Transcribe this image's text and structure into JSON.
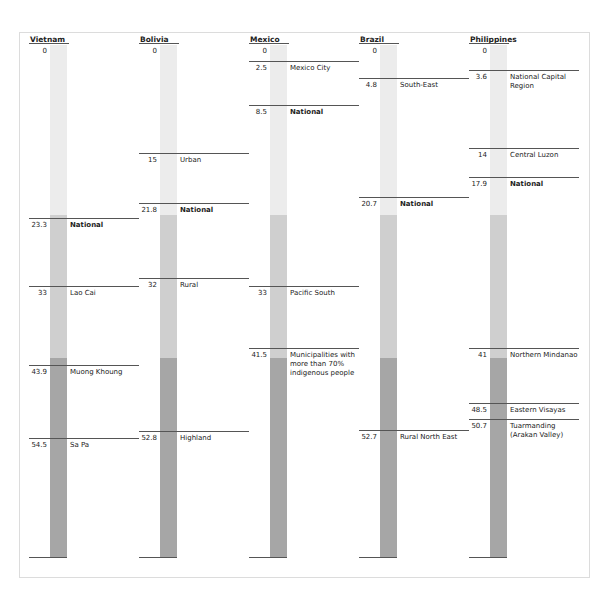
{
  "chart_data": {
    "type": "table",
    "title": "",
    "xlabel": "",
    "ylabel": "",
    "ylim": [
      0,
      60
    ],
    "band_colors": {
      "light": "#ececec",
      "mid": "#cfcfcf",
      "dark": "#a6a6a6"
    },
    "columns": [
      {
        "country": "Vietnam",
        "zero_label": "0",
        "markers": [
          {
            "value": 23.3,
            "value_label": "23.3",
            "label": "National",
            "bold": true,
            "y": 218
          },
          {
            "value": 33,
            "value_label": "33",
            "label": "Lao Cai",
            "bold": false,
            "y": 286
          },
          {
            "value": 43.9,
            "value_label": "43.9",
            "label": "Muong Khoung",
            "bold": false,
            "y": 365
          },
          {
            "value": 54.5,
            "value_label": "54.5",
            "label": "Sa Pa",
            "bold": false,
            "y": 438
          }
        ]
      },
      {
        "country": "Bolivia",
        "zero_label": "0",
        "markers": [
          {
            "value": 15,
            "value_label": "15",
            "label": "Urban",
            "bold": false,
            "y": 153
          },
          {
            "value": 21.8,
            "value_label": "21.8",
            "label": "National",
            "bold": true,
            "y": 203
          },
          {
            "value": 32,
            "value_label": "32",
            "label": "Rural",
            "bold": false,
            "y": 278
          },
          {
            "value": 52.8,
            "value_label": "52.8",
            "label": "Highland",
            "bold": false,
            "y": 431
          }
        ]
      },
      {
        "country": "Mexico",
        "zero_label": "0",
        "markers": [
          {
            "value": 2.5,
            "value_label": "2.5",
            "label": "Mexico City",
            "bold": false,
            "y": 61
          },
          {
            "value": 8.5,
            "value_label": "8.5",
            "label": "National",
            "bold": true,
            "y": 105
          },
          {
            "value": 33,
            "value_label": "33",
            "label": "Pacific South",
            "bold": false,
            "y": 286
          },
          {
            "value": 41.5,
            "value_label": "41.5",
            "label": "Municipalities with more than 70% indigenous people",
            "bold": false,
            "y": 348
          }
        ]
      },
      {
        "country": "Brazil",
        "zero_label": "0",
        "markers": [
          {
            "value": 4.8,
            "value_label": "4.8",
            "label": "South-East",
            "bold": false,
            "y": 78
          },
          {
            "value": 20.7,
            "value_label": "20.7",
            "label": "National",
            "bold": true,
            "y": 197
          },
          {
            "value": 52.7,
            "value_label": "52.7",
            "label": "Rural North East",
            "bold": false,
            "y": 430
          }
        ]
      },
      {
        "country": "Philippines",
        "zero_label": "0",
        "markers": [
          {
            "value": 3.6,
            "value_label": "3.6",
            "label": "National Capital Region",
            "bold": false,
            "y": 70
          },
          {
            "value": 14,
            "value_label": "14",
            "label": "Central Luzon",
            "bold": false,
            "y": 148
          },
          {
            "value": 17.9,
            "value_label": "17.9",
            "label": "National",
            "bold": true,
            "y": 177
          },
          {
            "value": 41,
            "value_label": "41",
            "label": "Northern Mindanao",
            "bold": false,
            "y": 348
          },
          {
            "value": 48.5,
            "value_label": "48.5",
            "label": "Eastern Visayas",
            "bold": false,
            "y": 403
          },
          {
            "value": 50.7,
            "value_label": "50.7",
            "label": "Tuarmanding (Arakan Valley)",
            "bold": false,
            "y": 419
          }
        ]
      }
    ]
  }
}
